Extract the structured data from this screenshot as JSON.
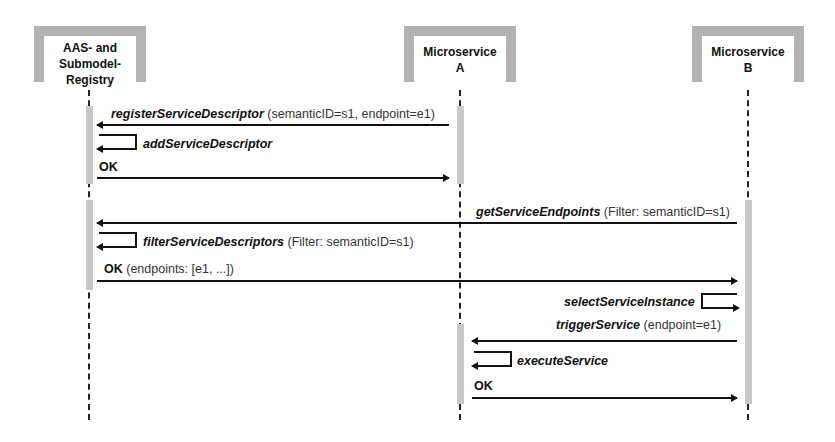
{
  "participants": [
    {
      "id": "registry",
      "label_lines": [
        "AAS- and",
        "Submodel-",
        "Registry"
      ]
    },
    {
      "id": "msa",
      "label_lines": [
        "Microservice",
        "A"
      ]
    },
    {
      "id": "msb",
      "label_lines": [
        "Microservice",
        "B"
      ]
    }
  ],
  "messages": [
    {
      "op": "registerServiceDescriptor",
      "args": "(semanticID=s1, endpoint=e1)",
      "from": "Microservice A",
      "to": "AAS- and Submodel-Registry"
    },
    {
      "op": "addServiceDescriptor",
      "args": "",
      "from": "AAS- and Submodel-Registry",
      "to": "AAS- and Submodel-Registry"
    },
    {
      "op": "OK",
      "args": "",
      "from": "AAS- and Submodel-Registry",
      "to": "Microservice A"
    },
    {
      "op": "getServiceEndpoints",
      "args": "(Filter: semanticID=s1)",
      "from": "Microservice B",
      "to": "AAS- and Submodel-Registry"
    },
    {
      "op": "filterServiceDescriptors",
      "args": "(Filter: semanticID=s1)",
      "from": "AAS- and Submodel-Registry",
      "to": "AAS- and Submodel-Registry"
    },
    {
      "op": "OK",
      "args": "(endpoints: [e1, ...])",
      "from": "AAS- and Submodel-Registry",
      "to": "Microservice B"
    },
    {
      "op": "selectServiceInstance",
      "args": "",
      "from": "Microservice B",
      "to": "Microservice B"
    },
    {
      "op": "triggerService",
      "args": "(endpoint=e1)",
      "from": "Microservice B",
      "to": "Microservice A"
    },
    {
      "op": "executeService",
      "args": "",
      "from": "Microservice A",
      "to": "Microservice A"
    },
    {
      "op": "OK",
      "args": "",
      "from": "Microservice A",
      "to": "Microservice B"
    }
  ]
}
